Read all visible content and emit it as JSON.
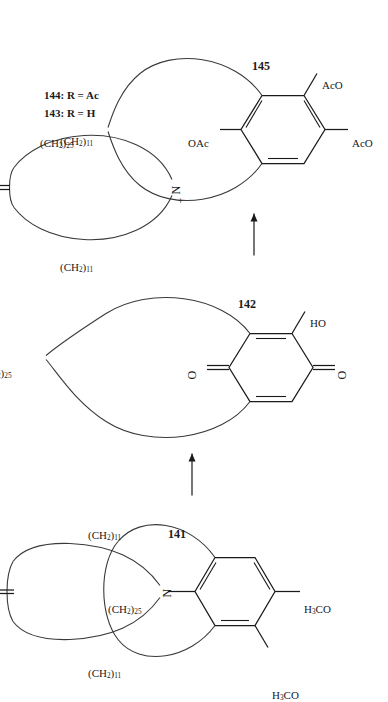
{
  "scheme": {
    "title": "Macrocyclic quinone / pyridinium reaction scheme",
    "structures": [
      {
        "id": "141",
        "number": "141",
        "kind": "macrocyclic-dimethoxy-aryl-ammonium-ketone",
        "ring_substituents": [
          "H3CO",
          "H3CO"
        ],
        "heteroatom": "N",
        "carbonyl": "O",
        "chains": [
          "(CH2)11",
          "(CH2)11",
          "(CH2)25"
        ]
      },
      {
        "id": "142",
        "number": "142",
        "kind": "macrocyclic-hydroxy-quinone",
        "ring_substituents": [
          "HO"
        ],
        "carbonyls": [
          "O",
          "O"
        ],
        "chains": [
          "(CH2)25"
        ],
        "byproduct": "+ R—N"
      },
      {
        "id": "143",
        "number": "143",
        "definition": "143: R = H",
        "kind": "macrocyclic-ammonium-ketone",
        "heteroatom": "N",
        "charge": "+",
        "carbonyl": "O",
        "chains": [
          "(CH2)11",
          "(CH2)11"
        ],
        "r_group": "R"
      },
      {
        "id": "144",
        "number": "144",
        "definition": "144: R = Ac"
      },
      {
        "id": "145",
        "number": "145",
        "kind": "macrocyclic-triacetoxy-arene",
        "ring_substituents": [
          "OAc",
          "AcO",
          "AcO"
        ],
        "chains": [
          "(CH2)25"
        ]
      }
    ],
    "labels": {
      "n_141": "141",
      "n_142": "142",
      "n_145": "145",
      "def_143": "143: R = H",
      "def_144": "144: R = Ac",
      "plus_rn": "+ R",
      "n_atom": "N",
      "plus_sign": "+",
      "ch2_11_a": "(CH",
      "ch2_25": "(CH",
      "o_atom": "O",
      "ho_group": "HO",
      "oac_group": "OAc",
      "aco_group": "AcO",
      "h3co_group": "H",
      "chain_11_full": "(CH2)11",
      "chain_25_full": "(CH2)25"
    },
    "arrows": [
      {
        "from": "141",
        "to": "142",
        "type": "reaction-arrow",
        "direction": "right"
      },
      {
        "from": "142",
        "to": "145",
        "type": "reaction-arrow",
        "direction": "right"
      }
    ],
    "colors": {
      "ink": "#1a1a1a",
      "chain": "#3a3a3a",
      "background": "#ffffff"
    }
  }
}
